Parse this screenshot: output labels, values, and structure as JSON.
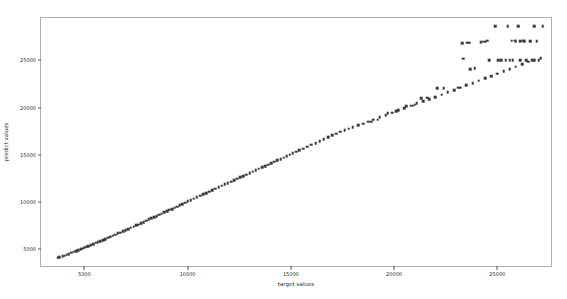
{
  "chart_data": {
    "type": "scatter",
    "title": "",
    "xlabel": "target values",
    "ylabel": "predict values",
    "xlim": [
      2900,
      27600
    ],
    "ylim": [
      3200,
      29500
    ],
    "xticks": [
      5000,
      10000,
      15000,
      20000,
      25000
    ],
    "yticks": [
      5000,
      10000,
      15000,
      20000,
      25000
    ],
    "xticklabels": [
      "5000",
      "10000",
      "15000",
      "20000",
      "25000"
    ],
    "yticklabels": [
      "5000",
      "10000",
      "15000",
      "20000",
      "25000"
    ],
    "grid": false,
    "legend": null,
    "marker_color": "#3b3b3b",
    "marker_size": 2.6,
    "series": [
      {
        "name": "predictions",
        "x": [
          3700,
          3780,
          3950,
          4050,
          4150,
          4250,
          4350,
          4480,
          4600,
          4700,
          4820,
          4900,
          5000,
          5100,
          5200,
          5300,
          5420,
          5550,
          5650,
          5780,
          5900,
          6020,
          6150,
          6250,
          6380,
          6500,
          6620,
          6750,
          6880,
          7000,
          7120,
          7250,
          7380,
          7500,
          7620,
          7750,
          7880,
          8000,
          8120,
          8250,
          8380,
          8500,
          8620,
          8750,
          8880,
          9000,
          9120,
          9250,
          9380,
          9500,
          9620,
          9750,
          9880,
          10000,
          10150,
          10300,
          10450,
          10600,
          10750,
          10900,
          11050,
          11200,
          11350,
          11500,
          11650,
          11800,
          11950,
          12100,
          12250,
          12400,
          12550,
          12700,
          12850,
          13000,
          13150,
          13300,
          13450,
          13600,
          13750,
          13900,
          14050,
          14200,
          14350,
          14500,
          14650,
          14800,
          14950,
          15100,
          15250,
          15400,
          15600,
          15800,
          16000,
          16200,
          16400,
          16600,
          16800,
          17000,
          17200,
          17400,
          17600,
          17800,
          18000,
          18250,
          18500,
          18750,
          19000,
          19300,
          19600,
          19900,
          20200,
          20500,
          20800,
          21100,
          21400,
          21700,
          22000,
          22300,
          22600,
          22900,
          23200,
          23500,
          23800,
          24100,
          24400,
          24700,
          25000,
          25300,
          25600,
          25900,
          26200,
          26500,
          26800,
          27100,
          23300,
          23350,
          24600,
          25050,
          25200,
          25400,
          25600,
          25750,
          26100,
          26400,
          26700,
          27000,
          24400,
          24500,
          25900,
          26100,
          26300,
          26600,
          26900,
          22100,
          22400,
          23100,
          23700,
          23900,
          21300,
          21600,
          20600,
          20900,
          21000,
          19700,
          20100,
          18900,
          19200,
          24900,
          25500,
          26000,
          26800,
          27200,
          25700,
          25850,
          26250,
          23550,
          23650,
          24200,
          24300
        ],
        "y": [
          4100,
          4150,
          4250,
          4300,
          4400,
          4450,
          4600,
          4700,
          4800,
          4900,
          5000,
          5050,
          5150,
          5250,
          5300,
          5400,
          5500,
          5650,
          5750,
          5850,
          5950,
          6050,
          6200,
          6300,
          6400,
          6500,
          6650,
          6750,
          6900,
          7000,
          7100,
          7250,
          7350,
          7500,
          7600,
          7750,
          7850,
          8000,
          8150,
          8250,
          8400,
          8500,
          8650,
          8750,
          8900,
          9000,
          9150,
          9250,
          9400,
          9500,
          9650,
          9750,
          9900,
          10050,
          10200,
          10350,
          10500,
          10650,
          10800,
          10950,
          11100,
          11250,
          11400,
          11550,
          11700,
          11850,
          12000,
          12150,
          12300,
          12450,
          12600,
          12750,
          12900,
          13050,
          13200,
          13350,
          13500,
          13650,
          13800,
          13950,
          14100,
          14250,
          14400,
          14550,
          14700,
          14850,
          15000,
          15150,
          15300,
          15450,
          15650,
          15850,
          16050,
          16250,
          16450,
          16650,
          16850,
          17050,
          17250,
          17450,
          17600,
          17750,
          17900,
          18100,
          18300,
          18500,
          18700,
          18950,
          19200,
          19450,
          19700,
          19950,
          20200,
          20450,
          20700,
          20900,
          21100,
          21350,
          21600,
          21850,
          22100,
          22350,
          22600,
          22850,
          23100,
          23350,
          23600,
          23850,
          24100,
          24350,
          24600,
          24850,
          25050,
          25250,
          26800,
          25200,
          25000,
          25000,
          25000,
          25000,
          25000,
          25000,
          25000,
          25000,
          25000,
          25000,
          27000,
          27100,
          27050,
          27050,
          27050,
          27050,
          27050,
          22050,
          22050,
          22100,
          24100,
          24150,
          21000,
          21050,
          20150,
          20200,
          20300,
          19400,
          19600,
          18500,
          18700,
          28600,
          28600,
          28600,
          28650,
          28650,
          27100,
          27100,
          27100,
          26900,
          26900,
          26950,
          27000
        ]
      }
    ]
  }
}
